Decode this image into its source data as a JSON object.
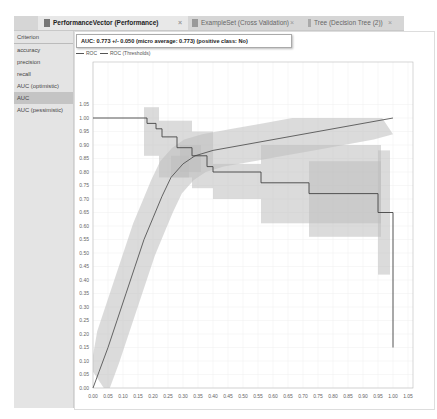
{
  "tabs": [
    {
      "label": "PerformanceVector (Performance)",
      "active": true,
      "icon": "document-icon"
    },
    {
      "label": "ExampleSet (Cross Validation)",
      "active": false,
      "icon": "table-icon"
    },
    {
      "label": "Tree (Decision Tree (2))",
      "active": false,
      "icon": "tree-icon"
    }
  ],
  "sidebar": {
    "header": "Criterion",
    "items": [
      {
        "label": "accuracy",
        "selected": false
      },
      {
        "label": "precision",
        "selected": false
      },
      {
        "label": "recall",
        "selected": false
      },
      {
        "label": "AUC (optimistic)",
        "selected": false
      },
      {
        "label": "AUC",
        "selected": true
      },
      {
        "label": "AUC (pessimistic)",
        "selected": false
      }
    ]
  },
  "auc_summary": "AUC: 0.773 +/- 0.050 (micro average: 0.773) (positive class: No)",
  "legend": [
    "ROC",
    "ROC (Thresholds)"
  ],
  "chart_data": {
    "type": "line",
    "title": "",
    "xlabel": "",
    "ylabel": "",
    "xlim": [
      0.0,
      1.05
    ],
    "ylim": [
      0.0,
      1.05
    ],
    "grid": true,
    "legend_position": "top-left",
    "x_ticks": [
      "0.00",
      "0.05",
      "0.10",
      "0.15",
      "0.20",
      "0.25",
      "0.30",
      "0.35",
      "0.40",
      "0.45",
      "0.50",
      "0.55",
      "0.60",
      "0.65",
      "0.70",
      "0.75",
      "0.80",
      "0.85",
      "0.90",
      "0.95",
      "1.00",
      "1.05"
    ],
    "y_ticks": [
      "0.00",
      "0.05",
      "0.10",
      "0.15",
      "0.20",
      "0.25",
      "0.30",
      "0.35",
      "0.40",
      "0.45",
      "0.50",
      "0.55",
      "0.60",
      "0.65",
      "0.70",
      "0.75",
      "0.80",
      "0.85",
      "0.90",
      "0.95",
      "1.00",
      "1.05"
    ],
    "series": [
      {
        "name": "ROC",
        "x": [
          0.0,
          0.02,
          0.05,
          0.08,
          0.11,
          0.14,
          0.17,
          0.2,
          0.23,
          0.26,
          0.3,
          0.34,
          0.4,
          0.5,
          0.6,
          0.7,
          0.8,
          0.9,
          1.0
        ],
        "y": [
          0.0,
          0.06,
          0.15,
          0.25,
          0.35,
          0.45,
          0.55,
          0.63,
          0.71,
          0.78,
          0.83,
          0.86,
          0.88,
          0.9,
          0.92,
          0.94,
          0.96,
          0.98,
          1.0
        ],
        "band_width": 0.06
      },
      {
        "name": "ROC (Thresholds)",
        "x": [
          0.0,
          0.18,
          0.18,
          0.21,
          0.21,
          0.23,
          0.23,
          0.28,
          0.28,
          0.33,
          0.33,
          0.38,
          0.38,
          0.4,
          0.4,
          0.56,
          0.56,
          0.72,
          0.72,
          0.95,
          0.95,
          1.0,
          1.0
        ],
        "y": [
          1.0,
          1.0,
          0.98,
          0.98,
          0.96,
          0.96,
          0.93,
          0.93,
          0.89,
          0.89,
          0.86,
          0.86,
          0.82,
          0.82,
          0.8,
          0.8,
          0.76,
          0.76,
          0.72,
          0.72,
          0.65,
          0.65,
          0.15
        ]
      }
    ]
  }
}
